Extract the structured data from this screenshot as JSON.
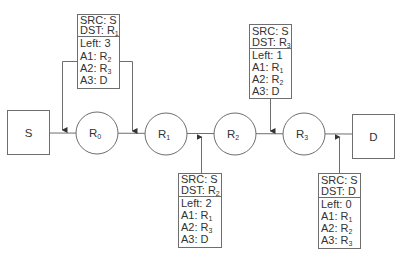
{
  "nodes": {
    "source": {
      "label": "S"
    },
    "destination": {
      "label": "D"
    },
    "routers": [
      {
        "base": "R",
        "sub": "0"
      },
      {
        "base": "R",
        "sub": "1"
      },
      {
        "base": "R",
        "sub": "2"
      },
      {
        "base": "R",
        "sub": "3"
      }
    ]
  },
  "packets": [
    {
      "src": "SRC: S",
      "dst_prefix": "DST: R",
      "dst_sub": "1",
      "left": "Left: 3",
      "hops": [
        {
          "prefix": "A1: R",
          "sub": "2"
        },
        {
          "prefix": "A2: R",
          "sub": "3"
        },
        {
          "prefix": "A3: D",
          "sub": ""
        }
      ]
    },
    {
      "src": "SRC: S",
      "dst_prefix": "DST: R",
      "dst_sub": "2",
      "left": "Left: 2",
      "hops": [
        {
          "prefix": "A1: R",
          "sub": "1"
        },
        {
          "prefix": "A2: R",
          "sub": "3"
        },
        {
          "prefix": "A3: D",
          "sub": ""
        }
      ]
    },
    {
      "src": "SRC: S",
      "dst_prefix": "DST: R",
      "dst_sub": "3",
      "left": "Left: 1",
      "hops": [
        {
          "prefix": "A1: R",
          "sub": "1"
        },
        {
          "prefix": "A2: R",
          "sub": "2"
        },
        {
          "prefix": "A3: D",
          "sub": ""
        }
      ]
    },
    {
      "src": "SRC: S",
      "dst_prefix": "DST: D",
      "dst_sub": "",
      "left": "Left: 0",
      "hops": [
        {
          "prefix": "A1: R",
          "sub": "1"
        },
        {
          "prefix": "A2: R",
          "sub": "2"
        },
        {
          "prefix": "A3: R",
          "sub": "3"
        }
      ]
    }
  ]
}
